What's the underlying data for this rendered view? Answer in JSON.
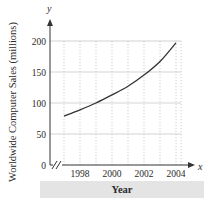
{
  "chart_data": {
    "type": "line",
    "title": "",
    "xlabel": "Year",
    "ylabel": "Worldwide Computer Sales (millions)",
    "x_axis_var": "x",
    "y_axis_var": "y",
    "xlim": [
      1996,
      2004.3
    ],
    "ylim": [
      0,
      200
    ],
    "x_ticks": [
      1998,
      2000,
      2002,
      2004
    ],
    "x_tick_labels": [
      "1998",
      "2000",
      "2002",
      "2004"
    ],
    "y_ticks": [
      0,
      50,
      100,
      150,
      200
    ],
    "y_tick_labels": [
      "0",
      "50",
      "100",
      "150",
      "200"
    ],
    "x_grid_years": [
      1997,
      1998,
      1999,
      2000,
      2001,
      2002,
      2003,
      2004
    ],
    "grid": true,
    "axis_break": true,
    "series": [
      {
        "name": "Worldwide Computer Sales",
        "x": [
          1997,
          1998,
          1999,
          2000,
          2001,
          2002,
          2003,
          2004
        ],
        "y": [
          79,
          89,
          100,
          113,
          127,
          145,
          167,
          197
        ]
      }
    ]
  }
}
